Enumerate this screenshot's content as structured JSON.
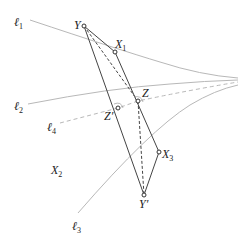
{
  "diagram": {
    "curves": [
      {
        "id": "l1",
        "label": "ℓ",
        "subscript": "1",
        "style": "solid",
        "color": "#b8b8b8"
      },
      {
        "id": "l2",
        "label": "ℓ",
        "subscript": "2",
        "style": "solid",
        "color": "#b8b8b8"
      },
      {
        "id": "l3",
        "label": "ℓ",
        "subscript": "3",
        "style": "solid",
        "color": "#b8b8b8"
      },
      {
        "id": "l4",
        "label": "ℓ",
        "subscript": "4",
        "style": "dashed",
        "color": "#b8b8b8"
      }
    ],
    "points": [
      {
        "id": "Y",
        "label": "Y",
        "subscript": ""
      },
      {
        "id": "X1",
        "label": "X",
        "subscript": "1"
      },
      {
        "id": "Z",
        "label": "Z",
        "subscript": ""
      },
      {
        "id": "Zp",
        "label": "Z′",
        "subscript": ""
      },
      {
        "id": "X3",
        "label": "X",
        "subscript": "3"
      },
      {
        "id": "Yp",
        "label": "Y′",
        "subscript": ""
      }
    ],
    "region_labels": [
      {
        "id": "X2",
        "label": "X",
        "subscript": "2"
      }
    ],
    "colors": {
      "curve": "#b8b8b8",
      "segment": "#444444",
      "point": "#333333"
    }
  }
}
